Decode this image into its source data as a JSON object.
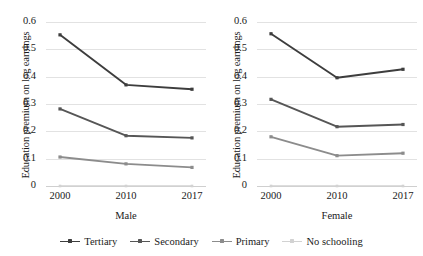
{
  "chart_data": {
    "type": "line",
    "title": "",
    "subtitle": "",
    "xlabel": "",
    "ylabel": "Education premium on log earnings",
    "ylim": [
      0,
      0.6
    ],
    "ytick_labels": [
      "0.6",
      "0.5",
      "0.4",
      "0.3",
      "0.2",
      "0.1",
      "0"
    ],
    "ytick_values": [
      0.6,
      0.5,
      0.4,
      0.3,
      0.2,
      0.1,
      0
    ],
    "grid": true,
    "legend_position": "bottom",
    "categories": [
      "2000",
      "2010",
      "2017"
    ],
    "x": [
      2000,
      2010,
      2017
    ],
    "panels": [
      {
        "name": "male",
        "label": "Male",
        "series": [
          {
            "name": "Tertiary",
            "values": [
              0.553,
              0.37,
              0.354
            ],
            "color": "#3d3d3d"
          },
          {
            "name": "Secondary",
            "values": [
              0.282,
              0.184,
              0.176
            ],
            "color": "#565656"
          },
          {
            "name": "Primary",
            "values": [
              0.106,
              0.081,
              0.068
            ],
            "color": "#8c8c8c"
          },
          {
            "name": "No schooling",
            "values": [
              0.0,
              0.0,
              0.0
            ],
            "color": "#d2d2d2"
          }
        ]
      },
      {
        "name": "female",
        "label": "Female",
        "series": [
          {
            "name": "Tertiary",
            "values": [
              0.557,
              0.396,
              0.427
            ],
            "color": "#3d3d3d"
          },
          {
            "name": "Secondary",
            "values": [
              0.317,
              0.217,
              0.225
            ],
            "color": "#565656"
          },
          {
            "name": "Primary",
            "values": [
              0.18,
              0.111,
              0.12
            ],
            "color": "#8c8c8c"
          },
          {
            "name": "No schooling",
            "values": [
              0.0,
              0.0,
              0.0
            ],
            "color": "#d2d2d2"
          }
        ]
      }
    ],
    "legend": [
      {
        "name": "Tertiary",
        "color": "#3d3d3d"
      },
      {
        "name": "Secondary",
        "color": "#565656"
      },
      {
        "name": "Primary",
        "color": "#8c8c8c"
      },
      {
        "name": "No schooling",
        "color": "#d2d2d2"
      }
    ],
    "colors": {
      "tertiary": "#3d3d3d",
      "secondary": "#565656",
      "primary": "#8c8c8c",
      "no_schooling": "#d2d2d2",
      "gridline": "#e2e2e2",
      "text": "#1a1a1a",
      "background": "#ffffff"
    }
  }
}
